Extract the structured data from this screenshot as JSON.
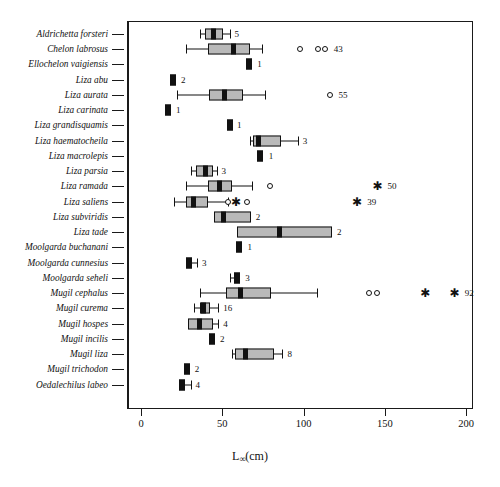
{
  "figure": {
    "x_axis_title_main": "L",
    "x_axis_title_sub": "∞",
    "x_axis_title_unit": "(cm)",
    "caption": "Fig. 1  Box plots of asymptotic length (L∞) by mullet species"
  },
  "chart_data": {
    "type": "boxplot",
    "title": "",
    "xlabel": "L∞(cm)",
    "ylabel": "",
    "xlim": [
      0,
      210
    ],
    "xticks": [
      0,
      50,
      100,
      150,
      200
    ],
    "xtick_labels": [
      "0",
      "50",
      "100",
      "150",
      "200"
    ],
    "grid": false,
    "legend": "none",
    "orientation": "horizontal",
    "n_label_note": "number at right of each row is the sample size (n)",
    "categories": [
      "Aldrichetta forsteri",
      "Chelon labrosus",
      "Ellochelon vaigiensis",
      "Liza abu",
      "Liza aurata",
      "Liza carinata",
      "Liza grandisquamis",
      "Liza haematocheila",
      "Liza macrolepis",
      "Liza parsia",
      "Liza ramada",
      "Liza saliens",
      "Liza subviridis",
      "Liza tade",
      "Moolgarda buchanani",
      "Moolgarda cunnesius",
      "Moolgarda seheli",
      "Mugil cephalus",
      "Mugil curema",
      "Mugil hospes",
      "Mugil incilis",
      "Mugil liza",
      "Mugil trichodon",
      "Oedalechilus labeo"
    ],
    "boxes": [
      {
        "label": "Aldrichetta forsteri",
        "n": "5",
        "whisker_low": 36.0,
        "q1": 39.5,
        "median": 44.5,
        "q3": 50.5,
        "whisker_high": 54.5,
        "outliers": [],
        "asterisks": []
      },
      {
        "label": "Chelon labrosus",
        "n": "43",
        "whisker_low": 27.5,
        "q1": 41.0,
        "median": 57.0,
        "q3": 67.0,
        "whisker_high": 74.5,
        "outliers": [
          98.0,
          109.0,
          113.0
        ],
        "asterisks": []
      },
      {
        "label": "Ellochelon vaigiensis",
        "n": "1",
        "whisker_low": null,
        "q1": 65.5,
        "median": 66.5,
        "q3": 68.5,
        "whisker_high": null,
        "outliers": [],
        "asterisks": []
      },
      {
        "label": "Liza abu",
        "n": "2",
        "whisker_low": null,
        "q1": 18.5,
        "median": 19.5,
        "q3": 21.5,
        "whisker_high": null,
        "outliers": [],
        "asterisks": []
      },
      {
        "label": "Liza aurata",
        "n": "55",
        "whisker_low": 22.0,
        "q1": 42.0,
        "median": 51.5,
        "q3": 63.0,
        "whisker_high": 76.5,
        "outliers": [
          116.0
        ],
        "asterisks": []
      },
      {
        "label": "Liza carinata",
        "n": "1",
        "whisker_low": null,
        "q1": 15.5,
        "median": 16.5,
        "q3": 18.5,
        "whisker_high": null,
        "outliers": [],
        "asterisks": []
      },
      {
        "label": "Liza grandisquamis",
        "n": "1",
        "whisker_low": null,
        "q1": 53.0,
        "median": 54.5,
        "q3": 56.0,
        "whisker_high": null,
        "outliers": [],
        "asterisks": []
      },
      {
        "label": "Liza haematocheila",
        "n": "3",
        "whisker_low": 67.0,
        "q1": 69.0,
        "median": 72.0,
        "q3": 86.0,
        "whisker_high": 96.5,
        "outliers": [],
        "asterisks": []
      },
      {
        "label": "Liza macrolepis",
        "n": "1",
        "whisker_low": null,
        "q1": 72.5,
        "median": 73.5,
        "q3": 75.5,
        "whisker_high": null,
        "outliers": [],
        "asterisks": []
      },
      {
        "label": "Liza parsia",
        "n": "3",
        "whisker_low": 31.0,
        "q1": 34.0,
        "median": 39.5,
        "q3": 44.0,
        "whisker_high": 46.5,
        "outliers": [],
        "asterisks": []
      },
      {
        "label": "Liza ramada",
        "n": "50",
        "whisker_low": 27.5,
        "q1": 41.0,
        "median": 48.5,
        "q3": 56.0,
        "whisker_high": 68.5,
        "outliers": [
          79.5
        ],
        "asterisks": [
          145.5
        ]
      },
      {
        "label": "Liza saliens",
        "n": "39",
        "whisker_low": 20.5,
        "q1": 27.5,
        "median": 32.0,
        "q3": 41.0,
        "whisker_high": 53.5,
        "outliers": [
          53.5,
          65.0
        ],
        "asterisks": [
          58.5,
          133.0
        ]
      },
      {
        "label": "Liza subviridis",
        "n": "2",
        "whisker_low": null,
        "q1": 45.0,
        "median": 50.5,
        "q3": 67.5,
        "whisker_high": null,
        "outliers": [],
        "asterisks": []
      },
      {
        "label": "Liza tade",
        "n": "2",
        "whisker_low": null,
        "q1": 59.0,
        "median": 85.5,
        "q3": 117.5,
        "whisker_high": null,
        "outliers": [],
        "asterisks": []
      },
      {
        "label": "Moolgarda buchanani",
        "n": "1",
        "whisker_low": null,
        "q1": 59.5,
        "median": 60.5,
        "q3": 62.5,
        "whisker_high": null,
        "outliers": [],
        "asterisks": []
      },
      {
        "label": "Moolgarda cunnesius",
        "n": "3",
        "whisker_low": null,
        "q1": 28.0,
        "median": 29.5,
        "q3": 32.0,
        "whisker_high": 34.5,
        "outliers": [],
        "asterisks": []
      },
      {
        "label": "Moolgarda seheli",
        "n": "3",
        "whisker_low": 54.5,
        "q1": 57.5,
        "median": 59.0,
        "q3": 61.0,
        "whisker_high": null,
        "outliers": [],
        "asterisks": []
      },
      {
        "label": "Mugil cephalus",
        "n": "92",
        "whisker_low": 36.5,
        "q1": 52.0,
        "median": 61.5,
        "q3": 80.0,
        "whisker_high": 108.5,
        "outliers": [
          140.5,
          145.5
        ],
        "asterisks": [
          175.0,
          193.0
        ]
      },
      {
        "label": "Mugil curema",
        "n": "16",
        "whisker_low": 32.5,
        "q1": 36.0,
        "median": 38.5,
        "q3": 42.5,
        "whisker_high": 47.5,
        "outliers": [],
        "asterisks": []
      },
      {
        "label": "Mugil hospes",
        "n": "4",
        "whisker_low": null,
        "q1": 29.0,
        "median": 36.0,
        "q3": 44.5,
        "whisker_high": 47.5,
        "outliers": [],
        "asterisks": []
      },
      {
        "label": "Mugil incilis",
        "n": "2",
        "whisker_low": null,
        "q1": 42.5,
        "median": 43.5,
        "q3": 45.5,
        "whisker_high": null,
        "outliers": [],
        "asterisks": []
      },
      {
        "label": "Mugil liza",
        "n": "8",
        "whisker_low": 56.0,
        "q1": 58.0,
        "median": 64.5,
        "q3": 82.0,
        "whisker_high": 87.0,
        "outliers": [],
        "asterisks": []
      },
      {
        "label": "Mugil trichodon",
        "n": "2",
        "whisker_low": null,
        "q1": 27.0,
        "median": 28.0,
        "q3": 30.0,
        "whisker_high": null,
        "outliers": [],
        "asterisks": []
      },
      {
        "label": "Oedalechilus labeo",
        "n": "4",
        "whisker_low": null,
        "q1": 24.0,
        "median": 25.5,
        "q3": 28.0,
        "whisker_high": 30.5,
        "outliers": [],
        "asterisks": []
      }
    ]
  }
}
